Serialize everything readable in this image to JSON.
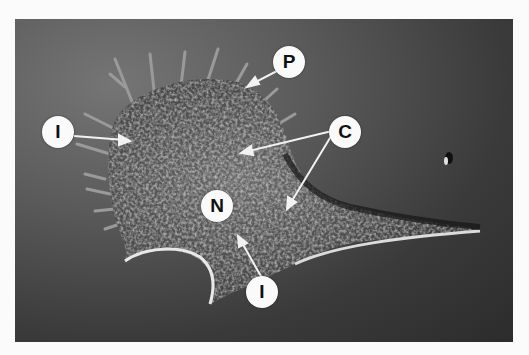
{
  "figure": {
    "type": "micrograph",
    "colors": {
      "background_light": "#757575",
      "background_dark": "#2c2c2c",
      "label_fill": "#fafafa",
      "label_text": "#111111",
      "arrow": "#f2f2f2"
    },
    "labels": [
      {
        "id": "P",
        "text": "P",
        "x": 289,
        "y": 62
      },
      {
        "id": "I1",
        "text": "I",
        "x": 58,
        "y": 132
      },
      {
        "id": "C",
        "text": "C",
        "x": 345,
        "y": 132
      },
      {
        "id": "N",
        "text": "N",
        "x": 217,
        "y": 206
      },
      {
        "id": "I2",
        "text": "I",
        "x": 262,
        "y": 292
      }
    ]
  }
}
